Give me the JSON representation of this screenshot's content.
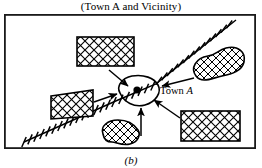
{
  "figure": {
    "title": "(Town A and Vicinity)",
    "caption": "(b)",
    "frame_color": "#1a1a1a",
    "background_color": "#ffffff",
    "ink_color": "#000000"
  },
  "map": {
    "center_place": {
      "name": "Town A",
      "label_text": "Town",
      "label_italic_text": "A",
      "marker": "town-dot",
      "marker_color": "#000000"
    },
    "railroad": {
      "name": "railroad-line",
      "symbol": "cross-tick-line",
      "from": "bottom-left",
      "to": "top-right",
      "passes_through": "Town A"
    },
    "hatched_regions": [
      {
        "id": "region-top-center",
        "shape": "rectangle",
        "fill_pattern": "cross-hatch",
        "arrow_to": "Town A"
      },
      {
        "id": "region-left",
        "shape": "quadrilateral",
        "fill_pattern": "cross-hatch",
        "arrow_to": "Town A"
      },
      {
        "id": "region-right",
        "shape": "blob",
        "fill_pattern": "cross-hatch",
        "arrow_to": "Town A"
      },
      {
        "id": "region-bottom-right",
        "shape": "rectangle",
        "fill_pattern": "cross-hatch",
        "arrow_to": "Town A"
      },
      {
        "id": "region-bottom-center",
        "shape": "blob",
        "fill_pattern": "cross-hatch",
        "arrow_to": "Town A"
      }
    ],
    "arrow_count": 5
  }
}
